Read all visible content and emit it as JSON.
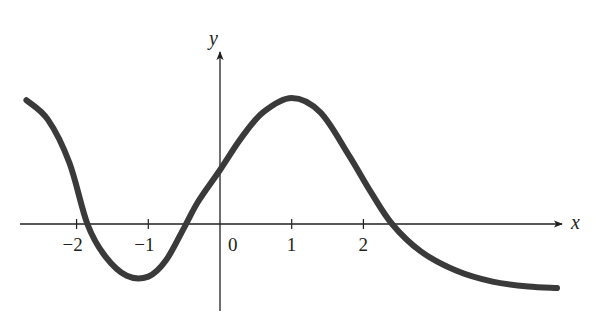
{
  "chart_data": {
    "type": "line",
    "title": "",
    "xlabel": "x",
    "ylabel": "y",
    "xlim": [
      -2.75,
      4.9
    ],
    "ylim": [
      -1.05,
      2.0
    ],
    "grid": false,
    "legend": null,
    "x_ticks": [
      -2,
      -1,
      0,
      1,
      2
    ],
    "x_tick_labels": [
      "−2",
      "−1",
      "0",
      "1",
      "2"
    ],
    "series": [
      {
        "name": "f(x)",
        "color": "#3a3a3a",
        "x": [
          -2.7,
          -2.4,
          -2.1,
          -1.85,
          -1.6,
          -1.3,
          -1.0,
          -0.75,
          -0.5,
          -0.3,
          0.0,
          0.3,
          0.6,
          1.0,
          1.4,
          1.8,
          2.1,
          2.4,
          2.8,
          3.3,
          3.8,
          4.3,
          4.7
        ],
        "y": [
          1.72,
          1.45,
          0.85,
          0.0,
          -0.45,
          -0.72,
          -0.73,
          -0.5,
          -0.05,
          0.32,
          0.75,
          1.2,
          1.55,
          1.75,
          1.55,
          0.95,
          0.45,
          0.0,
          -0.38,
          -0.65,
          -0.8,
          -0.87,
          -0.89
        ]
      }
    ],
    "annotations": {
      "local_max": [
        1.0,
        1.75
      ],
      "local_min": [
        -1.0,
        -0.73
      ],
      "x_intercepts": [
        -1.85,
        -0.5,
        2.4
      ],
      "y_intercept": 0.75
    }
  },
  "labels": {
    "x_axis": "x",
    "y_axis": "y",
    "ticks": [
      "−2",
      "−1",
      "0",
      "1",
      "2"
    ]
  },
  "colors": {
    "curve": "#3a3a3a",
    "axis": "#231f20"
  }
}
